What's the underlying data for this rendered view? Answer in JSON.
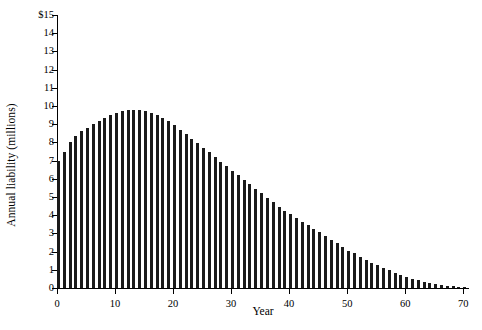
{
  "chart_data": {
    "type": "bar",
    "title": "",
    "subtitle": "",
    "xlabel": "Year",
    "ylabel": "Annual liability (millions)",
    "xlim": [
      0,
      71
    ],
    "ylim": [
      0,
      15
    ],
    "grid": false,
    "legend": null,
    "bar_color": "#1a1a1a",
    "y_tick_labels": [
      "$15",
      "14",
      "13",
      "12",
      "11",
      "10",
      "9",
      "8",
      "7",
      "6",
      "5",
      "4",
      "3",
      "2",
      "1",
      "0"
    ],
    "y_tick_values": [
      15,
      14,
      13,
      12,
      11,
      10,
      9,
      8,
      7,
      6,
      5,
      4,
      3,
      2,
      1,
      0
    ],
    "x_tick_labels": [
      "0",
      "10",
      "20",
      "30",
      "40",
      "50",
      "60",
      "70"
    ],
    "x_tick_values": [
      0,
      10,
      20,
      30,
      40,
      50,
      60,
      70
    ],
    "x": [
      0,
      1,
      2,
      3,
      4,
      5,
      6,
      7,
      8,
      9,
      10,
      11,
      12,
      13,
      14,
      15,
      16,
      17,
      18,
      19,
      20,
      21,
      22,
      23,
      24,
      25,
      26,
      27,
      28,
      29,
      30,
      31,
      32,
      33,
      34,
      35,
      36,
      37,
      38,
      39,
      40,
      41,
      42,
      43,
      44,
      45,
      46,
      47,
      48,
      49,
      50,
      51,
      52,
      53,
      54,
      55,
      56,
      57,
      58,
      59,
      60,
      61,
      62,
      63,
      64,
      65,
      66,
      67,
      68,
      69,
      70
    ],
    "categories": [
      0,
      1,
      2,
      3,
      4,
      5,
      6,
      7,
      8,
      9,
      10,
      11,
      12,
      13,
      14,
      15,
      16,
      17,
      18,
      19,
      20,
      21,
      22,
      23,
      24,
      25,
      26,
      27,
      28,
      29,
      30,
      31,
      32,
      33,
      34,
      35,
      36,
      37,
      38,
      39,
      40,
      41,
      42,
      43,
      44,
      45,
      46,
      47,
      48,
      49,
      50,
      51,
      52,
      53,
      54,
      55,
      56,
      57,
      58,
      59,
      60,
      61,
      62,
      63,
      64,
      65,
      66,
      67,
      68,
      69,
      70
    ],
    "values": [
      7.0,
      7.5,
      8.0,
      8.35,
      8.6,
      8.8,
      9.0,
      9.2,
      9.35,
      9.5,
      9.6,
      9.7,
      9.78,
      9.8,
      9.78,
      9.72,
      9.62,
      9.5,
      9.35,
      9.15,
      8.95,
      8.7,
      8.45,
      8.2,
      7.95,
      7.7,
      7.45,
      7.2,
      6.95,
      6.7,
      6.45,
      6.2,
      5.95,
      5.7,
      5.45,
      5.2,
      4.95,
      4.7,
      4.45,
      4.25,
      4.05,
      3.85,
      3.65,
      3.45,
      3.25,
      3.05,
      2.85,
      2.65,
      2.45,
      2.25,
      2.05,
      1.9,
      1.72,
      1.55,
      1.4,
      1.25,
      1.1,
      0.98,
      0.85,
      0.72,
      0.6,
      0.5,
      0.42,
      0.34,
      0.27,
      0.21,
      0.16,
      0.12,
      0.09,
      0.06,
      0.04
    ],
    "unit": "millions of dollars",
    "currency_symbol": "$",
    "peak_year": 13,
    "peak_value": 9.8
  }
}
